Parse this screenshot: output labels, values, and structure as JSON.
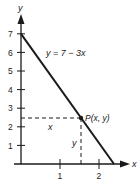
{
  "diagram": {
    "equation_label": "y = 7 − 3x",
    "point_label": "P(x, y)",
    "x_axis_label": "x",
    "y_axis_label": "y",
    "dashed_horizontal_label": "x",
    "dashed_vertical_label": "y",
    "y_ticks": [
      "1",
      "2",
      "3",
      "4",
      "5",
      "6",
      "7"
    ],
    "x_ticks": [
      "1",
      "2"
    ],
    "line": {
      "intercept": 7,
      "slope": -3,
      "x_intercept": "7/3"
    },
    "point": {
      "x": 1.5,
      "y": 2.5
    },
    "colors": {
      "ink": "#1a1a1a",
      "background": "#ffffff"
    }
  }
}
